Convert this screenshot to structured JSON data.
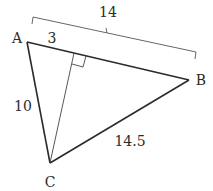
{
  "diagram": {
    "type": "triangle",
    "vertices": {
      "A": {
        "label": "A",
        "x": 27,
        "y": 42
      },
      "B": {
        "label": "B",
        "x": 189,
        "y": 80
      },
      "C": {
        "label": "C",
        "x": 50,
        "y": 163
      }
    },
    "altitude": {
      "from": "C",
      "foot": {
        "x": 74,
        "y": 53
      },
      "right_angle_marker": true
    },
    "measures": {
      "AB": "14",
      "A_to_foot": "3",
      "AC": "10",
      "BC": "14.5"
    },
    "labels": {
      "A": "A",
      "B": "B",
      "C": "C",
      "len_AB": "14",
      "len_A_foot": "3",
      "len_AC": "10",
      "len_BC": "14.5"
    },
    "colors": {
      "stroke": "#2b2b2b",
      "bracket": "#555555",
      "background": "#ffffff"
    }
  }
}
